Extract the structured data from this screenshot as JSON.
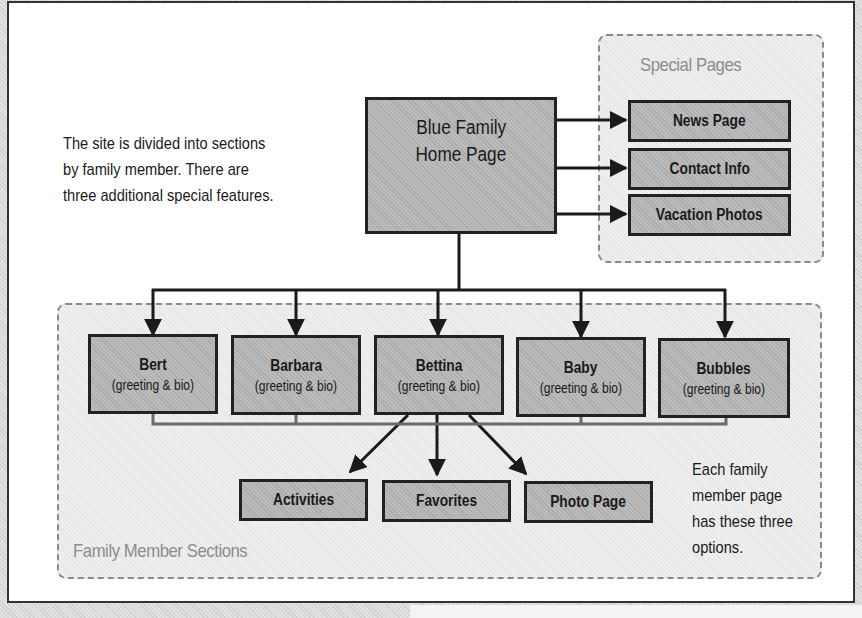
{
  "diagram": {
    "intro_note": [
      "The site is divided into sections",
      "by family member. There are",
      "three additional special features."
    ],
    "home_page": {
      "line1": "Blue Family",
      "line2": "Home Page"
    },
    "special_pages": {
      "label": "Special Pages",
      "items": [
        {
          "title": "News Page"
        },
        {
          "title": "Contact Info"
        },
        {
          "title": "Vacation Photos"
        }
      ]
    },
    "family_sections": {
      "label": "Family Member Sections",
      "members": [
        {
          "name": "Bert",
          "subtitle": "(greeting & bio)"
        },
        {
          "name": "Barbara",
          "subtitle": "(greeting & bio)"
        },
        {
          "name": "Bettina",
          "subtitle": "(greeting & bio)"
        },
        {
          "name": "Baby",
          "subtitle": "(greeting & bio)"
        },
        {
          "name": "Bubbles",
          "subtitle": "(greeting & bio)"
        }
      ],
      "options": [
        {
          "title": "Activities"
        },
        {
          "title": "Favorites"
        },
        {
          "title": "Photo Page"
        }
      ],
      "options_note": [
        "Each family",
        "member page",
        "has these three",
        "options."
      ]
    },
    "colors": {
      "box_fill": "#b4b4b4",
      "box_border": "#222222",
      "group_fill": "#ececec",
      "group_border": "#8a8a8a",
      "group_label": "#8c8c8c"
    }
  }
}
